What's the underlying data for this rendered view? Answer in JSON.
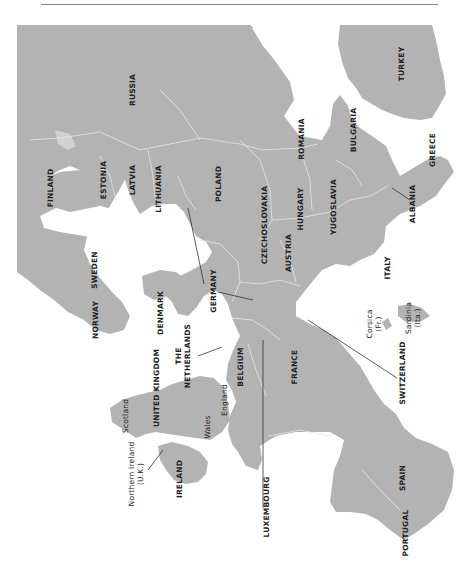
{
  "map": {
    "orientation": "rotated 90 degrees counter-clockwise",
    "land_color": "#b3b3b3",
    "border_color": "#e4e4e4",
    "water_color": "#ffffff",
    "leader_color": "#333333",
    "labels": {
      "russia": "RUSSIA",
      "turkey": "TURKEY",
      "finland": "FINLAND",
      "estonia": "ESTONIA",
      "latvia": "LATVIA",
      "lithuania": "LITHUANIA",
      "poland": "POLAND",
      "romania": "ROMANIA",
      "bulgaria": "BULGARIA",
      "greece": "GREECE",
      "czechoslovakia": "CZECHOSLOVAKIA",
      "hungary": "HUNGARY",
      "yugoslavia": "YUGOSLAVIA",
      "albania": "ALBANIA",
      "sweden": "SWEDEN",
      "austria": "AUSTRIA",
      "italy": "ITALY",
      "norway": "NORWAY",
      "denmark": "DENMARK",
      "germany": "GERMANY",
      "the_netherlands_1": "THE",
      "the_netherlands_2": "NETHERLANDS",
      "united_kingdom": "UNITED KINGDOM",
      "scotland": "Scotland",
      "england": "England",
      "wales": "Wales",
      "belgium": "BELGIUM",
      "france": "FRANCE",
      "corsica_1": "Corsica",
      "corsica_2": "(Fr.)",
      "sardinia_1": "Sardinia",
      "sardinia_2": "(Ita.)",
      "switzerland": "SWITZERLAND",
      "northern_ireland_1": "Northern Ireland",
      "northern_ireland_2": "(U.K.)",
      "ireland": "IRELAND",
      "luxembourg": "LUXEMBOURG",
      "spain": "SPAIN",
      "portugal": "PORTUGAL"
    }
  }
}
